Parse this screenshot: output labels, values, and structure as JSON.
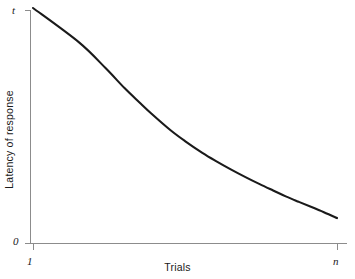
{
  "chart_data": {
    "type": "line",
    "title": "",
    "subtitle": "",
    "xlabel": "Trials",
    "ylabel": "Latency of response",
    "x_tick_labels": [
      "1",
      "n"
    ],
    "y_tick_labels": [
      "0",
      "t"
    ],
    "x_axis_start_label": "1",
    "x_axis_end_label": "n",
    "y_axis_start_label": "0",
    "y_axis_end_label": "t",
    "xlim": [
      1,
      "n"
    ],
    "ylim": [
      0,
      "t"
    ],
    "grid": false,
    "legend": null,
    "annotations": [],
    "series": [
      {
        "name": "latency",
        "description": "Monotonically decreasing negatively-accelerated learning curve",
        "x": [
          1,
          2,
          3,
          4,
          5,
          6,
          8,
          10,
          13,
          16,
          20,
          25,
          31,
          38,
          46,
          56,
          68,
          82,
          100
        ],
        "y": [
          1.0,
          0.855,
          0.745,
          0.66,
          0.6,
          0.552,
          0.482,
          0.435,
          0.385,
          0.35,
          0.315,
          0.282,
          0.252,
          0.225,
          0.2,
          0.177,
          0.155,
          0.133,
          0.108
        ]
      }
    ]
  },
  "style": {
    "axis_color": "#8c8c8c",
    "curve_color": "#1a1a1a",
    "background_color": "#ffffff",
    "text_color": "#1a1a1a"
  }
}
